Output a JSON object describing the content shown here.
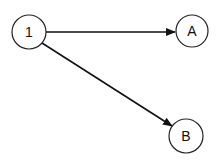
{
  "diagram": {
    "type": "directed-graph",
    "nodes": [
      {
        "id": "1",
        "label": "1",
        "cx": 29,
        "cy": 32,
        "r": 17
      },
      {
        "id": "A",
        "label": "A",
        "cx": 192,
        "cy": 31,
        "r": 16
      },
      {
        "id": "B",
        "label": "B",
        "cx": 186,
        "cy": 136,
        "r": 17
      }
    ],
    "edges": [
      {
        "from": "1",
        "to": "A"
      },
      {
        "from": "1",
        "to": "B"
      }
    ],
    "colors": {
      "stroke": "#111111",
      "background": "#ffffff"
    }
  }
}
